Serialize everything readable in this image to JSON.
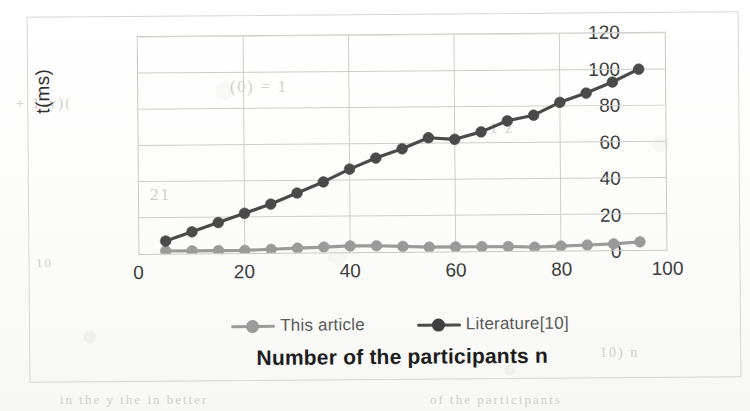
{
  "chart_data": {
    "type": "line",
    "title": "",
    "xlabel": "Number of the participants n",
    "ylabel": "t(ms)",
    "xlim": [
      0,
      100
    ],
    "ylim": [
      0,
      120
    ],
    "grid": true,
    "legend_position": "bottom",
    "x": [
      5,
      10,
      15,
      20,
      25,
      30,
      35,
      40,
      45,
      50,
      55,
      60,
      65,
      70,
      75,
      80,
      85,
      90,
      95
    ],
    "xticks": [
      "0",
      "20",
      "40",
      "60",
      "80",
      "100"
    ],
    "xtick_values": [
      0,
      20,
      40,
      60,
      80,
      100
    ],
    "yticks": [
      "0",
      "20",
      "40",
      "60",
      "80",
      "100",
      "120"
    ],
    "ytick_values": [
      0,
      20,
      40,
      60,
      80,
      100,
      120
    ],
    "series": [
      {
        "name": "This article",
        "color": "#9a9a9a",
        "marker": "circle",
        "values": [
          1.5,
          1.5,
          1.5,
          1.5,
          2.0,
          2.5,
          3.0,
          3.5,
          3.5,
          3.0,
          2.5,
          2.5,
          2.5,
          2.5,
          2.0,
          2.5,
          3.0,
          3.5,
          4.5
        ]
      },
      {
        "name": "Literature[10]",
        "color": "#4a4a4a",
        "marker": "circle",
        "values": [
          7,
          12,
          17,
          22,
          27,
          33,
          39,
          46,
          52,
          57,
          63,
          62,
          66,
          72,
          75,
          82,
          87,
          93,
          100
        ]
      }
    ]
  },
  "legend": {
    "items": [
      {
        "label": "This article",
        "color": "#9a9a9a"
      },
      {
        "label": "Literature[10]",
        "color": "#4a4a4a"
      }
    ]
  },
  "axes": {
    "y_title": "t(ms)",
    "x_title": "Number of the participants n"
  },
  "artifacts": {
    "ghost_marks": [
      "21",
      "(0)",
      "21",
      "1",
      "1)",
      "10)"
    ]
  }
}
